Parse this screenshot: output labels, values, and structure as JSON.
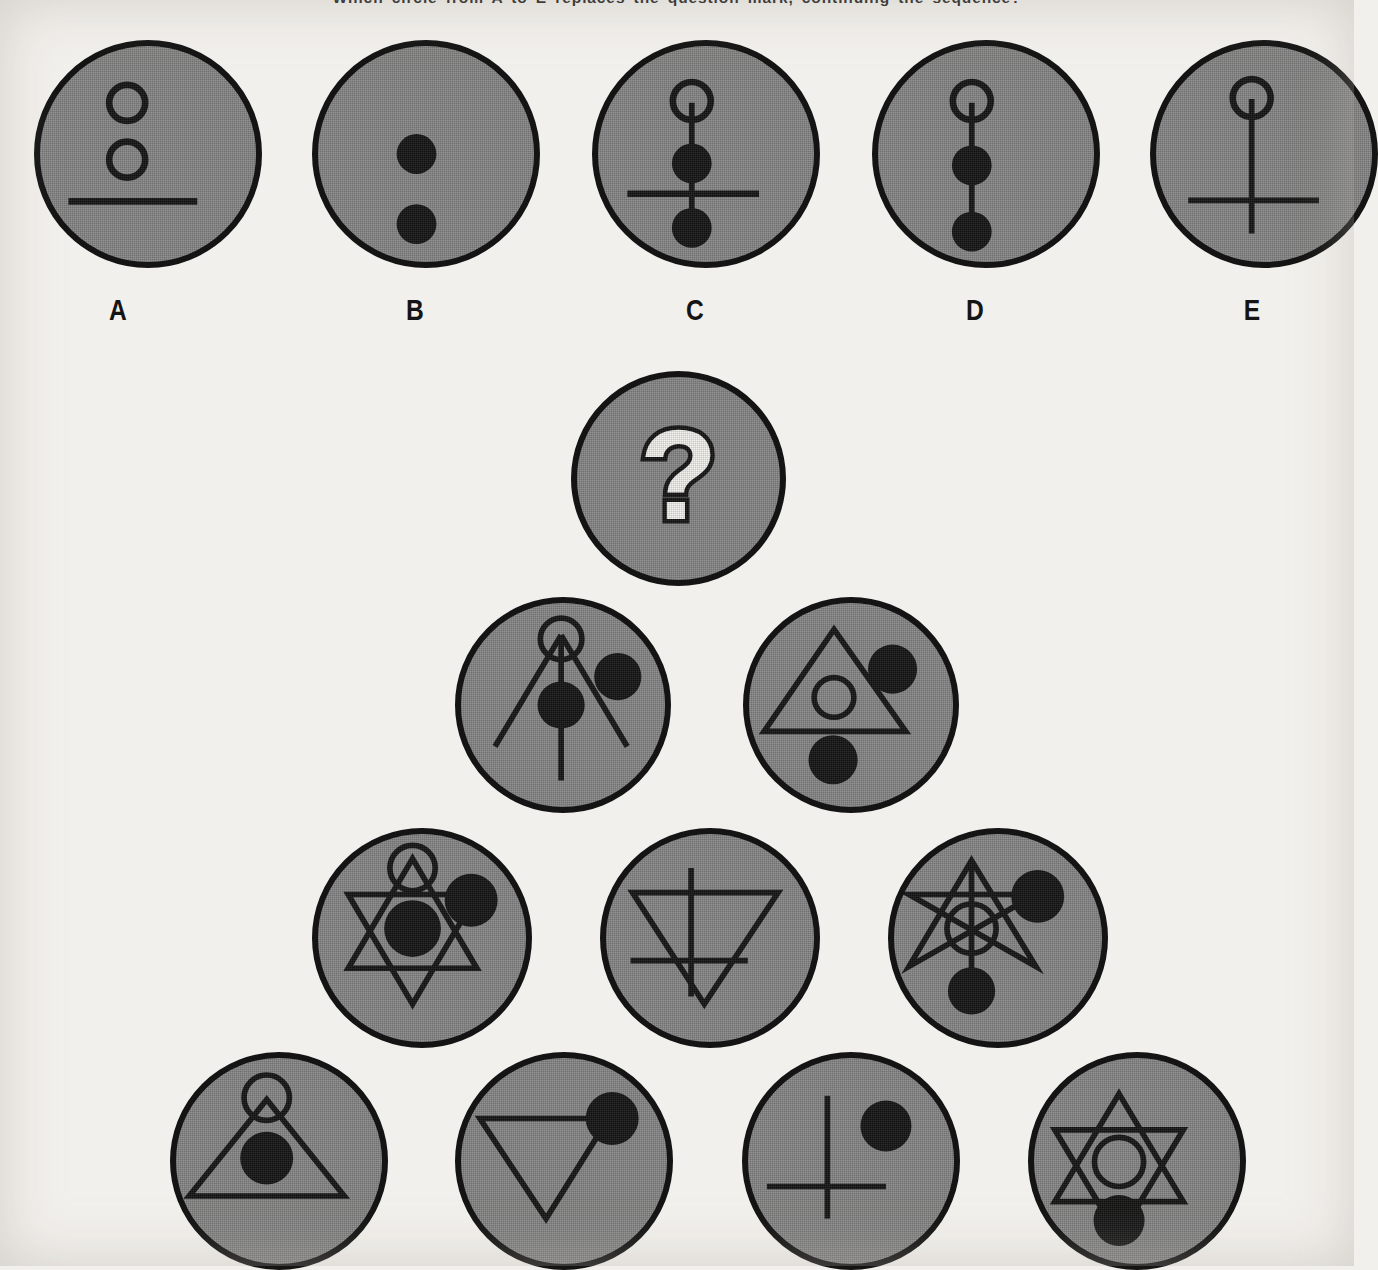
{
  "prompt": {
    "text": "Which circle from A to E replaces the question mark, continuing the sequence?"
  },
  "colors": {
    "paper": "#f2f0ec",
    "disc_fill": "#878787",
    "ink": "#141414"
  },
  "options_row": {
    "letters": [
      "A",
      "B",
      "C",
      "D",
      "E"
    ],
    "items": [
      {
        "letter": "A",
        "name": "option-a",
        "description": "two hollow circles stacked above a horizontal line",
        "elements": [
          "hollow-circle-upper",
          "hollow-circle-lower",
          "horizontal-line"
        ]
      },
      {
        "letter": "B",
        "name": "option-b",
        "description": "two filled dots stacked vertically",
        "elements": [
          "filled-dot-upper",
          "filled-dot-lower"
        ]
      },
      {
        "letter": "C",
        "name": "option-c",
        "description": "hollow circle on a vertical stem with two filled dots and a horizontal crossbar",
        "elements": [
          "hollow-circle-top",
          "vertical-stem",
          "filled-dot-upper",
          "horizontal-line",
          "filled-dot-lower"
        ]
      },
      {
        "letter": "D",
        "name": "option-d",
        "description": "hollow circle on a vertical stem with two filled dots, no crossbar",
        "elements": [
          "hollow-circle-top",
          "vertical-stem",
          "filled-dot-upper",
          "filled-dot-lower"
        ]
      },
      {
        "letter": "E",
        "name": "option-e",
        "description": "hollow circle on a long vertical stem with a low horizontal crossbar",
        "elements": [
          "hollow-circle-top",
          "vertical-stem",
          "horizontal-line"
        ]
      }
    ]
  },
  "question_cell": {
    "name": "question-mark-circle",
    "glyph": "?"
  },
  "pyramid": {
    "rows": [
      {
        "row": 2,
        "cells": [
          {
            "name": "pyramid-r2-c1",
            "description": "open compass A-frame with hollow circle at apex, vertical stem, centre filled dot and upper-right filled dot",
            "elements": [
              "hollow-circle-apex",
              "left-leg",
              "right-leg",
              "vertical-stem",
              "filled-dot-centre",
              "filled-dot-upper-right"
            ]
          },
          {
            "name": "pyramid-r2-c2",
            "description": "upward triangle containing a hollow circle, filled dot upper-right and filled dot lower-left",
            "elements": [
              "triangle-up",
              "hollow-circle-centre",
              "filled-dot-upper-right",
              "filled-dot-lower-left"
            ]
          }
        ]
      },
      {
        "row": 3,
        "cells": [
          {
            "name": "pyramid-r3-c1",
            "description": "hexagram with hollow circle at top apex, filled dot at centre and filled dot upper-right",
            "elements": [
              "hexagram",
              "hollow-circle-apex",
              "filled-dot-centre",
              "filled-dot-upper-right"
            ]
          },
          {
            "name": "pyramid-r3-c2",
            "description": "downward triangle crossed by a vertical stem and a low horizontal line",
            "elements": [
              "triangle-down",
              "vertical-stem",
              "horizontal-line"
            ]
          },
          {
            "name": "pyramid-r3-c3",
            "description": "open star figure with hollow circle at centre, filled dot upper-right and filled dot at bottom",
            "elements": [
              "open-star",
              "vertical-stem",
              "hollow-circle-centre",
              "filled-dot-upper-right",
              "filled-dot-bottom"
            ]
          }
        ]
      },
      {
        "row": 4,
        "cells": [
          {
            "name": "pyramid-r4-c1",
            "description": "upward triangle with hollow circle at apex and filled dot inside",
            "elements": [
              "triangle-up",
              "hollow-circle-apex",
              "filled-dot-centre"
            ]
          },
          {
            "name": "pyramid-r4-c2",
            "description": "downward triangle with filled dot at the upper-right vertex",
            "elements": [
              "triangle-down",
              "filled-dot-upper-right"
            ]
          },
          {
            "name": "pyramid-r4-c3",
            "description": "cross with a low horizontal bar and a filled dot upper-right",
            "elements": [
              "vertical-stem",
              "horizontal-line",
              "filled-dot-upper-right"
            ]
          },
          {
            "name": "pyramid-r4-c4",
            "description": "hexagram with hollow circle at centre and filled dot at the bottom vertex",
            "elements": [
              "hexagram",
              "hollow-circle-centre",
              "filled-dot-bottom"
            ]
          }
        ]
      }
    ]
  }
}
